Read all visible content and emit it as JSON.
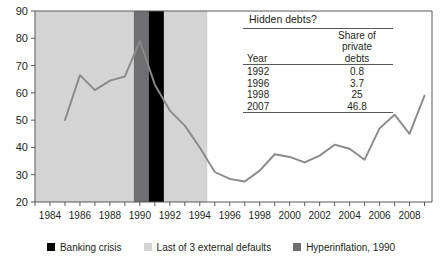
{
  "chart_data": {
    "type": "line",
    "title": "",
    "xlabel": "",
    "ylabel": "",
    "xlim": [
      1983,
      2009.5
    ],
    "ylim": [
      20,
      90
    ],
    "ytick_step": 10,
    "yticks": [
      20,
      30,
      40,
      50,
      60,
      70,
      80,
      90
    ],
    "ytick_labels": [
      "20",
      "30",
      "40",
      "50",
      "60",
      "70",
      "80",
      "90"
    ],
    "xticks": [
      1984,
      1986,
      1988,
      1990,
      1992,
      1994,
      1996,
      1998,
      2000,
      2002,
      2004,
      2006,
      2008
    ],
    "xtick_labels": [
      "1984",
      "1986",
      "1988",
      "1990",
      "1992",
      "1994",
      "1996",
      "1998",
      "2000",
      "2002",
      "2004",
      "2006",
      "2008"
    ],
    "minor_xticks_every": 1,
    "grid": false,
    "legend_position": "bottom",
    "series": [
      {
        "name": "Public debt share",
        "color": "#8a8a8a",
        "x": [
          1985,
          1986,
          1987,
          1988,
          1989,
          1990,
          1991,
          1992,
          1993,
          1994,
          1995,
          1996,
          1997,
          1998,
          1999,
          2000,
          2001,
          2002,
          2003,
          2004,
          2005,
          2006,
          2007,
          2008,
          2009
        ],
        "values": [
          50,
          66.5,
          61,
          64.5,
          66,
          79,
          63,
          53.5,
          48,
          40,
          31,
          28.5,
          27.5,
          31.5,
          37.5,
          36.5,
          34.5,
          37,
          41,
          39.5,
          35.5,
          47,
          52,
          45,
          59
        ]
      }
    ],
    "bands": [
      {
        "name": "Last of 3 external defaults",
        "color": "#d4d4d4",
        "x_start": 1983.0,
        "x_end": 1994.5
      },
      {
        "name": "Hyperinflation, 1990",
        "color": "#6d6e71",
        "x_start": 1989.6,
        "x_end": 1990.6
      },
      {
        "name": "Banking crisis",
        "color": "#000000",
        "x_start": 1990.6,
        "x_end": 1991.6
      }
    ],
    "legend": [
      {
        "label": "Banking crisis",
        "color": "#000000"
      },
      {
        "label": "Last of 3 external defaults",
        "color": "#d4d4d4"
      },
      {
        "label": "Hyperinflation, 1990",
        "color": "#6d6e71"
      }
    ],
    "annotation_table": {
      "title": "Hidden debts?",
      "columns": [
        "Year",
        "Share of private debts"
      ],
      "column_header_year": "Year",
      "column_header_share_lines": [
        "Share of",
        "private",
        "debts"
      ],
      "rows": [
        {
          "year": "1992",
          "share": "0.8"
        },
        {
          "year": "1996",
          "share": "3.7"
        },
        {
          "year": "1998",
          "share": "25"
        },
        {
          "year": "2007",
          "share": "46.8"
        }
      ]
    }
  }
}
